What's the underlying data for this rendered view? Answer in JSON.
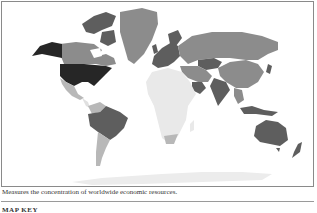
{
  "map": {
    "description": "World choropleth map, greyscale shading by economic resource concentration",
    "colors": {
      "highest": "#262626",
      "high": "#5e5e5e",
      "medium": "#8c8c8c",
      "low": "#b8b8b8",
      "lowest": "#e9e9e9",
      "ocean": "#ffffff",
      "border": "#8a8a8a"
    },
    "regions": [
      {
        "name": "United States",
        "shade": "highest"
      },
      {
        "name": "Alaska",
        "shade": "highest"
      },
      {
        "name": "Canada",
        "shade": "medium"
      },
      {
        "name": "Canadian Arctic",
        "shade": "high"
      },
      {
        "name": "Greenland",
        "shade": "medium"
      },
      {
        "name": "Mexico",
        "shade": "low"
      },
      {
        "name": "Brazil",
        "shade": "high"
      },
      {
        "name": "Argentina/Chile",
        "shade": "low"
      },
      {
        "name": "Colombia",
        "shade": "low"
      },
      {
        "name": "Europe",
        "shade": "high"
      },
      {
        "name": "Russia",
        "shade": "medium"
      },
      {
        "name": "Kazakhstan",
        "shade": "high"
      },
      {
        "name": "China",
        "shade": "medium"
      },
      {
        "name": "India",
        "shade": "high"
      },
      {
        "name": "Africa",
        "shade": "lowest"
      },
      {
        "name": "South Africa",
        "shade": "low"
      },
      {
        "name": "Saudi Arabia",
        "shade": "high"
      },
      {
        "name": "Indonesia",
        "shade": "high"
      },
      {
        "name": "Australia",
        "shade": "high"
      },
      {
        "name": "New Zealand",
        "shade": "high"
      },
      {
        "name": "Antarctica",
        "shade": "lowest"
      }
    ]
  },
  "caption": "Measures the concentration of worldwide economic resources.",
  "map_key": {
    "title": "MAP KEY"
  }
}
